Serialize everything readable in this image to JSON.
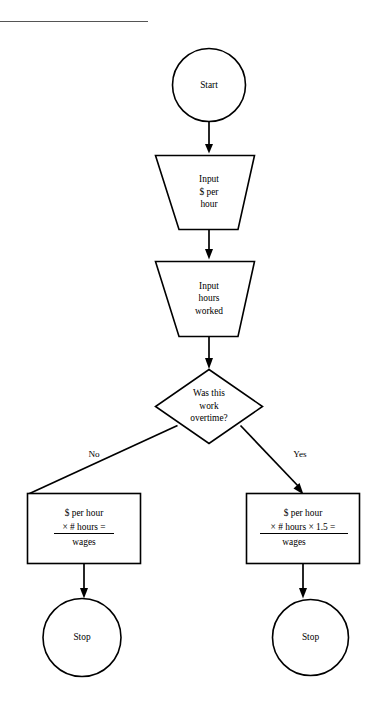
{
  "diagram": {
    "title_rule": "horizontal-rule",
    "nodes": [
      {
        "id": "start",
        "shape": "circle",
        "lines": [
          "Start"
        ]
      },
      {
        "id": "input-rate",
        "shape": "trapezoid",
        "lines": [
          "Input",
          "$ per",
          "hour"
        ]
      },
      {
        "id": "input-hours",
        "shape": "trapezoid",
        "lines": [
          "Input",
          "hours",
          "worked"
        ]
      },
      {
        "id": "decision-overtime",
        "shape": "diamond",
        "lines": [
          "Was this",
          "work",
          "overtime?"
        ]
      },
      {
        "id": "process-regular",
        "shape": "rectangle",
        "lines": [
          "$ per hour",
          "× # hours =",
          "wages"
        ]
      },
      {
        "id": "process-overtime",
        "shape": "rectangle",
        "lines": [
          "$ per hour",
          "× # hours × 1.5 =",
          "wages"
        ]
      },
      {
        "id": "stop-left",
        "shape": "circle",
        "lines": [
          "Stop"
        ]
      },
      {
        "id": "stop-right",
        "shape": "circle",
        "lines": [
          "Stop"
        ]
      }
    ],
    "edge_labels": {
      "no": "No",
      "yes": "Yes"
    },
    "colors": {
      "stroke": "#000000",
      "fill": "#ffffff",
      "rule": "#555555"
    }
  }
}
